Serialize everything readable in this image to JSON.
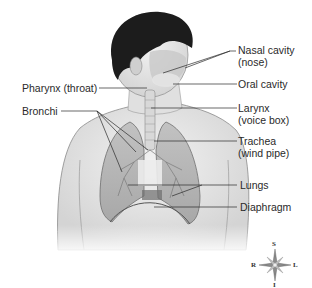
{
  "diagram": {
    "labels": {
      "nasal_cavity": {
        "line1": "Nasal cavity",
        "line2": "(nose)"
      },
      "oral_cavity": {
        "line1": "Oral cavity"
      },
      "pharynx": {
        "line1": "Pharynx (throat)"
      },
      "larynx": {
        "line1": "Larynx",
        "line2": "(voice box)"
      },
      "bronchi": {
        "line1": "Bronchi"
      },
      "trachea": {
        "line1": "Trachea",
        "line2": "(wind pipe)"
      },
      "lungs": {
        "line1": "Lungs"
      },
      "diaphragm": {
        "line1": "Diaphragm"
      }
    },
    "compass": {
      "top": "S",
      "bottom": "I",
      "left": "R",
      "right": "L"
    }
  }
}
